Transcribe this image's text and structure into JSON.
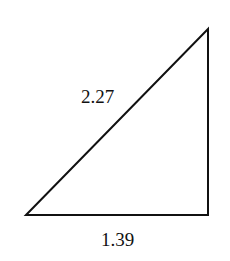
{
  "diagram": {
    "type": "right-triangle",
    "vertices": {
      "bottom_left": [
        26,
        215
      ],
      "top_right": [
        208,
        29
      ],
      "bottom_right": [
        208,
        215
      ]
    },
    "labels": {
      "hypotenuse": "2.27",
      "base": "1.39"
    },
    "stroke_color": "#111111",
    "background": "#ffffff"
  }
}
